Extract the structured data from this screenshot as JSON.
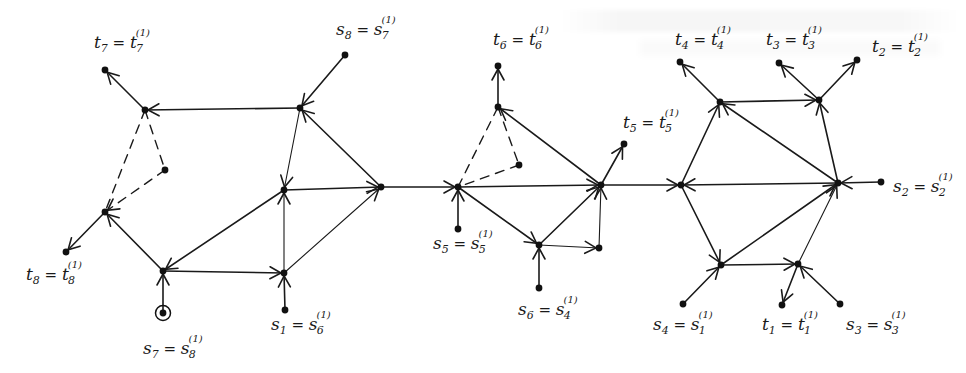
{
  "figure": {
    "ink_color": "#1a1a1a",
    "background": "#ffffff"
  },
  "nodes": [
    {
      "id": "A",
      "x": 145,
      "y": 110
    },
    {
      "id": "t7",
      "x": 105,
      "y": 70
    },
    {
      "id": "s8",
      "x": 345,
      "y": 55
    },
    {
      "id": "B",
      "x": 300,
      "y": 108
    },
    {
      "id": "C",
      "x": 165,
      "y": 170
    },
    {
      "id": "D",
      "x": 105,
      "y": 212
    },
    {
      "id": "t8",
      "x": 66,
      "y": 252
    },
    {
      "id": "E",
      "x": 163,
      "y": 271
    },
    {
      "id": "s7",
      "x": 163,
      "y": 313,
      "circled": true
    },
    {
      "id": "F",
      "x": 284,
      "y": 190
    },
    {
      "id": "G",
      "x": 381,
      "y": 187
    },
    {
      "id": "H",
      "x": 284,
      "y": 273
    },
    {
      "id": "s1",
      "x": 285,
      "y": 310
    },
    {
      "id": "I",
      "x": 458,
      "y": 187
    },
    {
      "id": "s5",
      "x": 458,
      "y": 229
    },
    {
      "id": "J",
      "x": 498,
      "y": 107
    },
    {
      "id": "t6",
      "x": 498,
      "y": 66
    },
    {
      "id": "K",
      "x": 519,
      "y": 165
    },
    {
      "id": "L",
      "x": 601,
      "y": 185
    },
    {
      "id": "t5",
      "x": 624,
      "y": 144
    },
    {
      "id": "M",
      "x": 539,
      "y": 245
    },
    {
      "id": "N",
      "x": 599,
      "y": 248
    },
    {
      "id": "s6",
      "x": 539,
      "y": 288
    },
    {
      "id": "O",
      "x": 681,
      "y": 185
    },
    {
      "id": "P",
      "x": 720,
      "y": 102
    },
    {
      "id": "Q",
      "x": 819,
      "y": 100
    },
    {
      "id": "t4",
      "x": 680,
      "y": 62
    },
    {
      "id": "t3",
      "x": 779,
      "y": 63
    },
    {
      "id": "t2",
      "x": 857,
      "y": 60
    },
    {
      "id": "R",
      "x": 838,
      "y": 183
    },
    {
      "id": "s2",
      "x": 881,
      "y": 182
    },
    {
      "id": "S",
      "x": 721,
      "y": 265
    },
    {
      "id": "T",
      "x": 798,
      "y": 264
    },
    {
      "id": "s4",
      "x": 683,
      "y": 304
    },
    {
      "id": "t1",
      "x": 782,
      "y": 305
    },
    {
      "id": "s3",
      "x": 840,
      "y": 304
    }
  ],
  "edges": [
    {
      "from": "A",
      "to": "t7",
      "arrow": true
    },
    {
      "from": "s8",
      "to": "B",
      "arrow": true
    },
    {
      "from": "B",
      "to": "A",
      "arrow": true
    },
    {
      "from": "A",
      "to": "C",
      "dashed": true
    },
    {
      "from": "A",
      "to": "D",
      "dashed": true
    },
    {
      "from": "C",
      "to": "D",
      "dashed": true,
      "arrow": true
    },
    {
      "from": "D",
      "to": "t8",
      "arrow": true
    },
    {
      "from": "E",
      "to": "D",
      "arrow": true
    },
    {
      "from": "s7",
      "to": "E",
      "arrow": true
    },
    {
      "from": "F",
      "to": "E",
      "arrow": true
    },
    {
      "from": "E",
      "to": "H",
      "arrow": true
    },
    {
      "from": "B",
      "to": "F",
      "arrow": true,
      "thin": true
    },
    {
      "from": "G",
      "to": "B",
      "arrow": true
    },
    {
      "from": "F",
      "to": "G",
      "arrow": true
    },
    {
      "from": "H",
      "to": "F",
      "arrow": true,
      "thin": true
    },
    {
      "from": "s1",
      "to": "H",
      "arrow": true
    },
    {
      "from": "H",
      "to": "G",
      "arrow": true,
      "thin": true
    },
    {
      "from": "G",
      "to": "I",
      "arrow": true
    },
    {
      "from": "s5",
      "to": "I",
      "arrow": true
    },
    {
      "from": "I",
      "to": "J",
      "dashed": true
    },
    {
      "from": "J",
      "to": "K",
      "dashed": true
    },
    {
      "from": "K",
      "to": "I",
      "dashed": true
    },
    {
      "from": "J",
      "to": "t6",
      "arrow": true
    },
    {
      "from": "L",
      "to": "J",
      "arrow": true
    },
    {
      "from": "I",
      "to": "L",
      "arrow": true
    },
    {
      "from": "L",
      "to": "t5",
      "arrow": true
    },
    {
      "from": "I",
      "to": "M",
      "arrow": true
    },
    {
      "from": "s6",
      "to": "M",
      "arrow": true
    },
    {
      "from": "M",
      "to": "L",
      "arrow": true
    },
    {
      "from": "M",
      "to": "N",
      "arrow": true,
      "thin": true
    },
    {
      "from": "N",
      "to": "L",
      "arrow": true,
      "thin": true
    },
    {
      "from": "L",
      "to": "O",
      "arrow": true
    },
    {
      "from": "O",
      "to": "P",
      "arrow": true
    },
    {
      "from": "P",
      "to": "t4",
      "arrow": true
    },
    {
      "from": "P",
      "to": "Q",
      "arrow": true
    },
    {
      "from": "Q",
      "to": "t3",
      "arrow": true
    },
    {
      "from": "Q",
      "to": "t2",
      "arrow": true
    },
    {
      "from": "R",
      "to": "P",
      "arrow": true
    },
    {
      "from": "R",
      "to": "Q",
      "arrow": true
    },
    {
      "from": "R",
      "to": "O",
      "arrow": true
    },
    {
      "from": "s2",
      "to": "R",
      "arrow": true
    },
    {
      "from": "O",
      "to": "S",
      "arrow": true
    },
    {
      "from": "S",
      "to": "R",
      "arrow": true
    },
    {
      "from": "S",
      "to": "T",
      "arrow": true
    },
    {
      "from": "T",
      "to": "R",
      "arrow": true,
      "thin": true
    },
    {
      "from": "s4",
      "to": "S",
      "arrow": true
    },
    {
      "from": "T",
      "to": "t1",
      "arrow": true
    },
    {
      "from": "s3",
      "to": "T",
      "arrow": true
    }
  ],
  "labels": [
    {
      "id": "lbl-t7",
      "base": "t",
      "sub": "7",
      "rhs_base": "t",
      "rhs_sub": "7",
      "sup": "(1)",
      "x": 94,
      "y": 48
    },
    {
      "id": "lbl-s8",
      "base": "s",
      "sub": "8",
      "rhs_base": "s",
      "rhs_sub": "7",
      "sup": "(1)",
      "x": 336,
      "y": 35
    },
    {
      "id": "lbl-t8",
      "base": "t",
      "sub": "8",
      "rhs_base": "t",
      "rhs_sub": "8",
      "sup": "(1)",
      "x": 26,
      "y": 280
    },
    {
      "id": "lbl-s7",
      "base": "s",
      "sub": "7",
      "rhs_base": "s",
      "rhs_sub": "8",
      "sup": "(1)",
      "x": 143,
      "y": 354
    },
    {
      "id": "lbl-s1",
      "base": "s",
      "sub": "1",
      "rhs_base": "s",
      "rhs_sub": "6",
      "sup": "(1)",
      "x": 271,
      "y": 330
    },
    {
      "id": "lbl-t6",
      "base": "t",
      "sub": "6",
      "rhs_base": "t",
      "rhs_sub": "6",
      "sup": "(1)",
      "x": 493,
      "y": 45
    },
    {
      "id": "lbl-t5",
      "base": "t",
      "sub": "5",
      "rhs_base": "t",
      "rhs_sub": "5",
      "sup": "(1)",
      "x": 623,
      "y": 128
    },
    {
      "id": "lbl-s5",
      "base": "s",
      "sub": "5",
      "rhs_base": "s",
      "rhs_sub": "5",
      "sup": "(1)",
      "x": 433,
      "y": 249
    },
    {
      "id": "lbl-s6",
      "base": "s",
      "sub": "6",
      "rhs_base": "s",
      "rhs_sub": "4",
      "sup": "(1)",
      "x": 518,
      "y": 315
    },
    {
      "id": "lbl-t4",
      "base": "t",
      "sub": "4",
      "rhs_base": "t",
      "rhs_sub": "4",
      "sup": "(1)",
      "x": 675,
      "y": 45
    },
    {
      "id": "lbl-t3",
      "base": "t",
      "sub": "3",
      "rhs_base": "t",
      "rhs_sub": "3",
      "sup": "(1)",
      "x": 766,
      "y": 45
    },
    {
      "id": "lbl-t2",
      "base": "t",
      "sub": "2",
      "rhs_base": "t",
      "rhs_sub": "2",
      "sup": "(1)",
      "x": 872,
      "y": 52
    },
    {
      "id": "lbl-s2",
      "base": "s",
      "sub": "2",
      "rhs_base": "s",
      "rhs_sub": "2",
      "sup": "(1)",
      "x": 893,
      "y": 192
    },
    {
      "id": "lbl-s4",
      "base": "s",
      "sub": "4",
      "rhs_base": "s",
      "rhs_sub": "1",
      "sup": "(1)",
      "x": 653,
      "y": 330
    },
    {
      "id": "lbl-t1",
      "base": "t",
      "sub": "1",
      "rhs_base": "t",
      "rhs_sub": "1",
      "sup": "(1)",
      "x": 762,
      "y": 330
    },
    {
      "id": "lbl-s3",
      "base": "s",
      "sub": "3",
      "rhs_base": "s",
      "rhs_sub": "3",
      "sup": "(1)",
      "x": 846,
      "y": 330
    }
  ]
}
